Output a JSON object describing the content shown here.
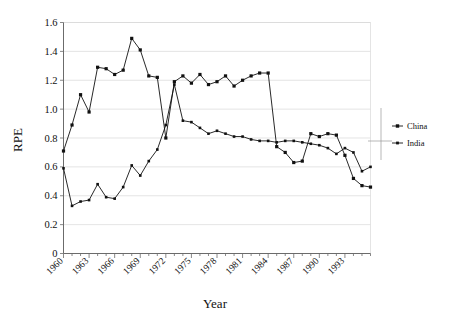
{
  "chart_data": {
    "type": "line",
    "title": "",
    "xlabel": "Year",
    "ylabel": "RPE",
    "xlim": [
      1960,
      1996
    ],
    "ylim": [
      0,
      1.6
    ],
    "yticks": [
      0,
      0.2,
      0.4,
      0.6,
      0.8,
      1.0,
      1.2,
      1.4,
      1.6
    ],
    "ytick_labels": [
      "0",
      "0.2",
      "0.4",
      "0.6",
      "0.8",
      "1.0",
      "1.2",
      "1.4",
      "1.6"
    ],
    "x": [
      1960,
      1961,
      1962,
      1963,
      1964,
      1965,
      1966,
      1967,
      1968,
      1969,
      1970,
      1971,
      1972,
      1973,
      1974,
      1975,
      1976,
      1977,
      1978,
      1979,
      1980,
      1981,
      1982,
      1983,
      1984,
      1985,
      1986,
      1987,
      1988,
      1989,
      1990,
      1991,
      1992,
      1993,
      1994,
      1995,
      1996
    ],
    "xtick_labels": [
      "1960",
      "1963",
      "1966",
      "1969",
      "1972",
      "1975",
      "1978",
      "1981",
      "1984",
      "1987",
      "1990",
      "1993"
    ],
    "xtick_label_years": [
      1960,
      1963,
      1966,
      1969,
      1972,
      1975,
      1978,
      1981,
      1984,
      1987,
      1990,
      1993
    ],
    "grid": true,
    "grid_axis": "y",
    "legend_position": "right",
    "series": [
      {
        "name": "China",
        "marker": "square",
        "color": "#111111",
        "values": [
          0.71,
          0.89,
          1.1,
          0.98,
          1.29,
          1.28,
          1.24,
          1.27,
          1.49,
          1.41,
          1.23,
          1.22,
          0.8,
          1.19,
          1.23,
          1.18,
          1.24,
          1.17,
          1.19,
          1.23,
          1.16,
          1.2,
          1.23,
          1.25,
          1.25,
          0.74,
          0.7,
          0.63,
          0.64,
          0.83,
          0.81,
          0.83,
          0.82,
          0.68,
          0.52,
          0.47,
          0.46
        ]
      },
      {
        "name": "India",
        "marker": "square",
        "color": "#111111",
        "values": [
          0.59,
          0.33,
          0.36,
          0.37,
          0.48,
          0.39,
          0.38,
          0.46,
          0.61,
          0.54,
          0.64,
          0.72,
          0.89,
          1.17,
          0.92,
          0.91,
          0.87,
          0.83,
          0.85,
          0.83,
          0.81,
          0.81,
          0.79,
          0.78,
          0.78,
          0.77,
          0.78,
          0.78,
          0.77,
          0.76,
          0.75,
          0.73,
          0.69,
          0.73,
          0.7,
          0.57,
          0.6
        ]
      }
    ]
  },
  "legend": {
    "entries": [
      {
        "label": "China"
      },
      {
        "label": "India"
      }
    ]
  },
  "axes": {
    "y_title": "RPE",
    "x_title": "Year"
  }
}
